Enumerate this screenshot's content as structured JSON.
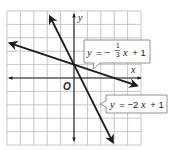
{
  "chart_data": {
    "type": "line",
    "title": "",
    "xlabel": "x",
    "ylabel": "y",
    "origin_label": "O",
    "xlim": [
      -5,
      5
    ],
    "ylim": [
      -5,
      5
    ],
    "grid": true,
    "grid_step": 1,
    "series": [
      {
        "name": "y = -1/3 x + 1",
        "slope": -0.3333,
        "intercept": 1,
        "x_range": [
          -4.8,
          4.7
        ],
        "label": {
          "prefix": "y = −",
          "frac_num": "1",
          "frac_den": "3",
          "suffix": "x + 1"
        }
      },
      {
        "name": "y = -2x + 1",
        "slope": -2,
        "intercept": 1,
        "x_range": [
          -1.8,
          2.9
        ],
        "label": {
          "text_y": "y",
          "text_eq": " = −2",
          "text_x": "x",
          "text_rest": " + 1"
        }
      }
    ],
    "intersection": {
      "x": 0,
      "y": 1
    }
  },
  "labels": {
    "x_axis": "x",
    "y_axis": "y",
    "origin": "O",
    "eq1_y": "y",
    "eq1_eq": "= −",
    "eq1_num": "1",
    "eq1_den": "3",
    "eq1_x": "x",
    "eq1_rest": "+ 1",
    "eq2_y": "y",
    "eq2_eq": "= −2",
    "eq2_x": "x",
    "eq2_rest": "+ 1"
  },
  "colors": {
    "line": "#1c1c1c",
    "grid": "#b9b9b9",
    "callout_border": "#777777"
  }
}
